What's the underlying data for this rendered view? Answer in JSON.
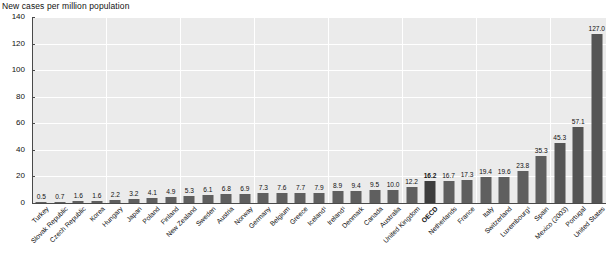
{
  "chart_data": {
    "type": "bar",
    "title": "New cases per million population",
    "xlabel": "",
    "ylabel": "",
    "ylim": [
      0,
      140
    ],
    "yticks": [
      0,
      20,
      40,
      60,
      80,
      100,
      120,
      140
    ],
    "grid": true,
    "legend": "none",
    "categories": [
      "Turkey",
      "Slovak Republic",
      "Czech Republic",
      "Korea",
      "Hungary",
      "Japan",
      "Poland",
      "Finland",
      "New Zealand",
      "Sweden",
      "Austria",
      "Norway",
      "Germany",
      "Belgium",
      "Greece",
      "Iceland¹",
      "Ireland¹",
      "Denmark",
      "Canada",
      "Australia",
      "United Kingdom",
      "OECD",
      "Netherlands",
      "France",
      "Italy",
      "Switzerland",
      "Luxembourg¹",
      "Spain",
      "Mexico (2003)",
      "Portugal",
      "United States"
    ],
    "values": [
      0.5,
      0.7,
      1.6,
      1.6,
      2.2,
      3.2,
      4.1,
      4.9,
      5.3,
      6.1,
      6.8,
      6.9,
      7.3,
      7.6,
      7.7,
      7.9,
      8.9,
      9.4,
      9.5,
      10.0,
      12.2,
      16.2,
      16.7,
      17.3,
      19.4,
      19.6,
      23.8,
      35.3,
      45.3,
      57.1,
      127.0
    ],
    "value_labels": [
      "0.5",
      "0.7",
      "1.6",
      "1.6",
      "2.2",
      "3.2",
      "4.1",
      "4.9",
      "5.3",
      "6.1",
      "6.8",
      "6.9",
      "7.3",
      "7.6",
      "7.7",
      "7.9",
      "8.9",
      "9.4",
      "9.5",
      "10.0",
      "12.2",
      "16.2",
      "16.7",
      "17.3",
      "19.4",
      "19.6",
      "23.8",
      "35.3",
      "45.3",
      "57.1",
      "127.0"
    ],
    "highlight_index": 21,
    "colors": {
      "bar": "#5f5f5f",
      "bar_highlight": "#3c3c3c",
      "plot_background": "#ebebeb",
      "gridline": "#ffffff",
      "axis": "#4a4a4a",
      "text": "#111111"
    }
  }
}
